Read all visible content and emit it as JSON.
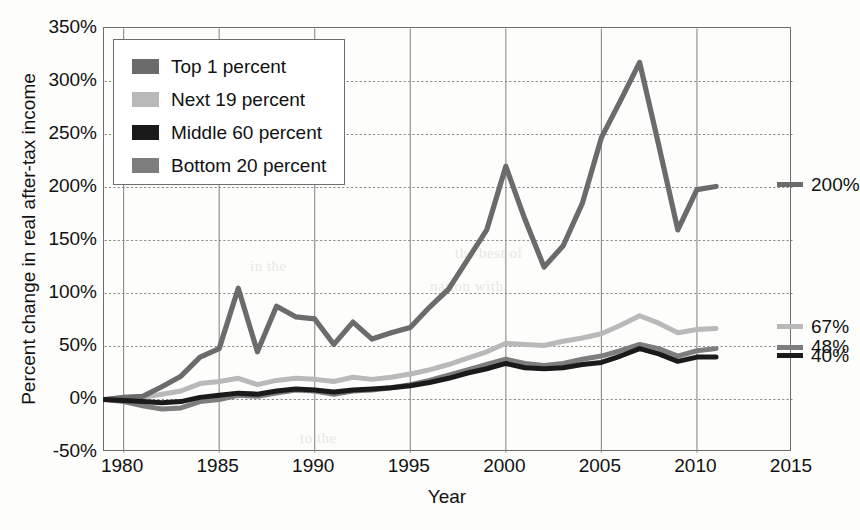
{
  "chart_data": {
    "type": "line",
    "title": "",
    "xlabel": "Year",
    "ylabel": "Percent change in real after-tax income",
    "xlim": [
      1979,
      2015
    ],
    "ylim": [
      -50,
      350
    ],
    "xticks": [
      "1980",
      "1985",
      "1990",
      "1995",
      "2000",
      "2005",
      "2010",
      "2015"
    ],
    "xtick_values": [
      1980,
      1985,
      1990,
      1995,
      2000,
      2005,
      2010,
      2015
    ],
    "yticks": [
      "-50%",
      "0%",
      "50%",
      "100%",
      "150%",
      "200%",
      "250%",
      "300%",
      "350%"
    ],
    "ytick_values": [
      -50,
      0,
      50,
      100,
      150,
      200,
      250,
      300,
      350
    ],
    "grid": "both",
    "legend_position": "upper-left",
    "x": [
      1979,
      1980,
      1981,
      1982,
      1983,
      1984,
      1985,
      1986,
      1987,
      1988,
      1989,
      1990,
      1991,
      1992,
      1993,
      1994,
      1995,
      1996,
      1997,
      1998,
      1999,
      2000,
      2001,
      2002,
      2003,
      2004,
      2005,
      2006,
      2007,
      2008,
      2009,
      2010,
      2011
    ],
    "series": [
      {
        "name": "Top 1 percent",
        "color": "#6b6b6b",
        "end_label": "200%",
        "values": [
          0,
          2,
          3,
          12,
          22,
          40,
          48,
          105,
          45,
          88,
          78,
          76,
          52,
          73,
          57,
          63,
          68,
          87,
          104,
          132,
          160,
          220,
          170,
          125,
          145,
          185,
          247,
          282,
          318,
          240,
          160,
          198,
          201
        ]
      },
      {
        "name": "Next 19 percent",
        "color": "#b9b9b9",
        "end_label": "67%",
        "values": [
          0,
          1,
          2,
          5,
          8,
          15,
          17,
          20,
          14,
          18,
          20,
          19,
          17,
          21,
          19,
          21,
          24,
          28,
          33,
          39,
          45,
          53,
          52,
          51,
          55,
          58,
          62,
          70,
          79,
          72,
          63,
          66,
          67
        ]
      },
      {
        "name": "Middle 60 percent",
        "color": "#1a1a1a",
        "end_label": "40%",
        "values": [
          0,
          -1,
          -2,
          -3,
          -2,
          2,
          4,
          6,
          5,
          8,
          10,
          9,
          7,
          9,
          10,
          11,
          13,
          16,
          20,
          25,
          29,
          34,
          30,
          29,
          30,
          33,
          35,
          41,
          48,
          43,
          36,
          40,
          40
        ]
      },
      {
        "name": "Bottom 20 percent",
        "color": "#7d7d7d",
        "end_label": "48%",
        "values": [
          0,
          -2,
          -6,
          -9,
          -8,
          -2,
          0,
          4,
          3,
          6,
          9,
          8,
          5,
          8,
          9,
          11,
          14,
          18,
          23,
          28,
          33,
          38,
          34,
          32,
          34,
          38,
          41,
          46,
          52,
          48,
          41,
          46,
          48
        ]
      }
    ]
  },
  "legend": {
    "items": [
      {
        "label": "Top 1 percent",
        "color": "#6b6b6b"
      },
      {
        "label": "Next 19 percent",
        "color": "#b9b9b9"
      },
      {
        "label": "Middle 60 percent",
        "color": "#1a1a1a"
      },
      {
        "label": "Bottom 20 percent",
        "color": "#7d7d7d"
      }
    ]
  },
  "ghost_text": {
    "a": "the best of",
    "b": "nation with",
    "c": "in the",
    "d": "to the"
  }
}
